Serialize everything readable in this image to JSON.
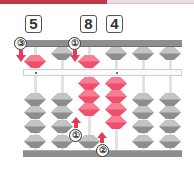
{
  "header": {
    "bar_color": "#c0394a",
    "bar_secondary_color": "#e9dfe1"
  },
  "digits": [
    {
      "label": "5",
      "column": 1
    },
    {
      "label": "8",
      "column": 3
    },
    {
      "label": "4",
      "column": 4
    }
  ],
  "abacus": {
    "columns": 6,
    "colors": {
      "active_bead": "#ee4f6c",
      "inactive_bead": "#9c9c9c",
      "frame": "#8e8e8e",
      "beam": "#fbfbfb"
    },
    "heaven_beads": [
      {
        "column": 1,
        "state": "down",
        "color": "red"
      },
      {
        "column": 2,
        "state": "up",
        "color": "grey"
      },
      {
        "column": 3,
        "state": "down",
        "color": "red"
      },
      {
        "column": 4,
        "state": "up",
        "color": "grey"
      },
      {
        "column": 5,
        "state": "up",
        "color": "grey"
      },
      {
        "column": 6,
        "state": "up",
        "color": "grey"
      }
    ],
    "earth_beads": [
      {
        "column": 1,
        "up_count": 0,
        "color": "grey"
      },
      {
        "column": 2,
        "up_count": 0,
        "color": "grey"
      },
      {
        "column": 3,
        "up_count": 3,
        "color": "red"
      },
      {
        "column": 4,
        "up_count": 4,
        "color": "red"
      },
      {
        "column": 5,
        "up_count": 0,
        "color": "grey"
      },
      {
        "column": 6,
        "up_count": 0,
        "color": "grey"
      }
    ],
    "unit_dots": [
      1,
      4
    ]
  },
  "step_markers": [
    {
      "label": "③",
      "direction": "down",
      "column": 1
    },
    {
      "label": "①",
      "direction": "down",
      "column": 3
    },
    {
      "label": "①",
      "direction": "up",
      "column": 3
    },
    {
      "label": "②",
      "direction": "up",
      "column": 4
    }
  ]
}
